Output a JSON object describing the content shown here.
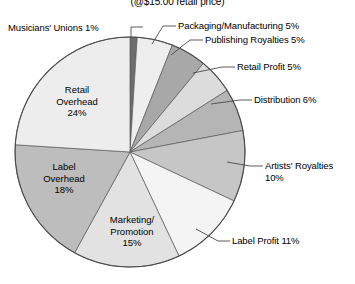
{
  "title": "(@$15.00 retail price)",
  "chart_data": {
    "type": "pie",
    "title": "(@$15.00 retail price)",
    "xlabel": "",
    "ylabel": "",
    "legend_position": "none",
    "grid": false,
    "unit": "%",
    "total": 100,
    "categories": [
      "Musicians' Unions",
      "Packaging/Manufacturing",
      "Publishing Royalties",
      "Retail Profit",
      "Distribution",
      "Artists' Royalties",
      "Label Profit",
      "Marketing/Promotion",
      "Label Overhead",
      "Retail Overhead"
    ],
    "values": [
      1,
      5,
      5,
      5,
      6,
      10,
      11,
      15,
      18,
      24
    ],
    "colors": [
      "#6d6d6d",
      "#eeeeee",
      "#a8a8a8",
      "#dcdcdc",
      "#b5b5b5",
      "#c6c6c6",
      "#f4f4f4",
      "#e2e2e2",
      "#bdbdbd",
      "#ededed"
    ],
    "slices": [
      {
        "label": "Musicians' Unions",
        "value": 1,
        "value_text": "1%",
        "text": "Musicians' Unions 1%",
        "color": "#6d6d6d",
        "label_placement": "outside-left"
      },
      {
        "label": "Packaging/Manufacturing",
        "value": 5,
        "value_text": "5%",
        "text": "Packaging/Manufacturing 5%",
        "color": "#eeeeee",
        "label_placement": "outside-right"
      },
      {
        "label": "Publishing Royalties",
        "value": 5,
        "value_text": "5%",
        "text": "Publishing Royalties 5%",
        "color": "#a8a8a8",
        "label_placement": "outside-right"
      },
      {
        "label": "Retail Profit",
        "value": 5,
        "value_text": "5%",
        "text": "Retail Profit 5%",
        "color": "#dcdcdc",
        "label_placement": "outside-right"
      },
      {
        "label": "Distribution",
        "value": 6,
        "value_text": "6%",
        "text": "Distribution 6%",
        "color": "#b5b5b5",
        "label_placement": "outside-right"
      },
      {
        "label": "Artists' Royalties",
        "value": 10,
        "value_text": "10%",
        "text": "Artists' Royalties 10%",
        "color": "#c6c6c6",
        "label_placement": "outside-right"
      },
      {
        "label": "Label Profit",
        "value": 11,
        "value_text": "11%",
        "text": "Label Profit 11%",
        "color": "#f4f4f4",
        "label_placement": "outside-right"
      },
      {
        "label": "Marketing/Promotion",
        "value": 15,
        "value_text": "15%",
        "text": "Marketing/ Promotion 15%",
        "color": "#e2e2e2",
        "label_placement": "inside"
      },
      {
        "label": "Label Overhead",
        "value": 18,
        "value_text": "18%",
        "text": "Label Overhead 18%",
        "color": "#bdbdbd",
        "label_placement": "inside"
      },
      {
        "label": "Retail Overhead",
        "value": 24,
        "value_text": "24%",
        "text": "Retail Overhead 24%",
        "color": "#ededed",
        "label_placement": "inside"
      }
    ]
  },
  "callouts": {
    "musicians_unions": "Musicians' Unions 1%",
    "packaging": "Packaging/Manufacturing 5%",
    "publishing": "Publishing Royalties 5%",
    "retail_profit": "Retail Profit 5%",
    "distribution": "Distribution 6%",
    "artists_royalties_l1": "Artists' Royalties",
    "artists_royalties_l2": "10%",
    "label_profit": "Label Profit 11%"
  },
  "inpie": {
    "retail_overhead_l1": "Retail",
    "retail_overhead_l2": "Overhead",
    "retail_overhead_l3": "24%",
    "label_overhead_l1": "Label",
    "label_overhead_l2": "Overhead",
    "label_overhead_l3": "18%",
    "marketing_l1": "Marketing/",
    "marketing_l2": "Promotion",
    "marketing_l3": "15%"
  }
}
